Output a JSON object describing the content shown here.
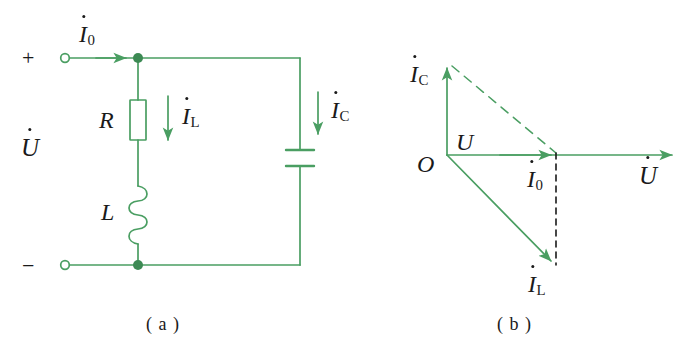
{
  "figure": {
    "title_a": "( a )",
    "title_b": "( b )",
    "line_color": "#4a9e62",
    "dark_line_color": "#3d8a54",
    "text_color": "#1a1a1a",
    "background": "#ffffff"
  },
  "circuit": {
    "terminal_plus": "+",
    "terminal_minus": "−",
    "source_label": "U",
    "current_source": "I",
    "current_source_sub": "0",
    "resistor_label": "R",
    "inductor_label": "L",
    "current_inductor": "I",
    "current_inductor_sub": "L",
    "current_capacitor": "I",
    "current_capacitor_sub": "C",
    "components": [
      {
        "name": "resistor",
        "label": "R"
      },
      {
        "name": "inductor",
        "label": "L"
      },
      {
        "name": "capacitor",
        "label": ""
      }
    ],
    "nodes": [
      "top-node",
      "bottom-node"
    ],
    "terminals": [
      "positive-terminal",
      "negative-terminal"
    ]
  },
  "phasor": {
    "origin_label": "O",
    "voltage_axis_label": "U",
    "voltage_phasor": "U",
    "u_segment_label": "U",
    "current_capacitor": "I",
    "current_capacitor_sub": "C",
    "current_total": "I",
    "current_total_sub": "0",
    "current_inductor": "I",
    "current_inductor_sub": "L",
    "vectors": [
      {
        "name": "Ic",
        "label": "I",
        "sub": "C",
        "direction": "up",
        "style": "solid"
      },
      {
        "name": "U",
        "label": "U",
        "sub": "",
        "direction": "right",
        "style": "solid"
      },
      {
        "name": "I0",
        "label": "I",
        "sub": "0",
        "direction": "right",
        "style": "solid"
      },
      {
        "name": "IL",
        "label": "I",
        "sub": "L",
        "direction": "down-right",
        "style": "solid"
      },
      {
        "name": "Ic-resultant-guide",
        "label": "",
        "sub": "",
        "direction": "diagonal",
        "style": "dashed"
      },
      {
        "name": "IL-projection-guide",
        "label": "",
        "sub": "",
        "direction": "down",
        "style": "dashed"
      }
    ]
  }
}
